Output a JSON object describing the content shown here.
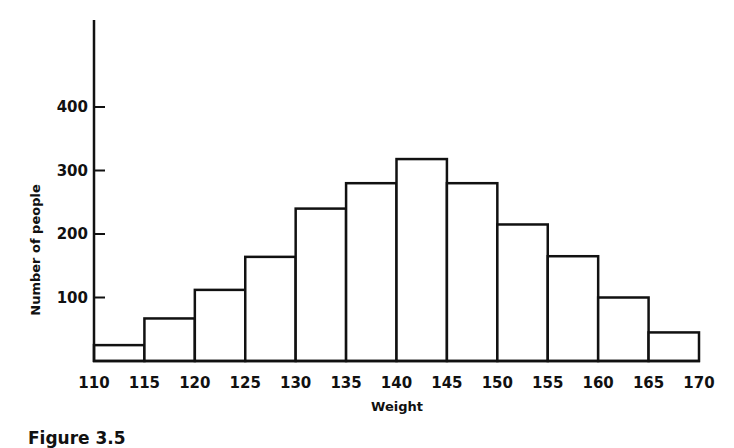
{
  "chart_data": {
    "type": "bar",
    "subtype": "histogram",
    "title": "",
    "xlabel": "Weight",
    "ylabel": "Number of people",
    "bin_edges": [
      110,
      115,
      120,
      125,
      130,
      135,
      140,
      145,
      150,
      155,
      160,
      165,
      170
    ],
    "categories": [
      "110-115",
      "115-120",
      "120-125",
      "125-130",
      "130-135",
      "135-140",
      "140-145",
      "145-150",
      "150-155",
      "155-160",
      "160-165",
      "165-170"
    ],
    "values": [
      25,
      67,
      112,
      164,
      240,
      280,
      318,
      280,
      215,
      165,
      100,
      45
    ],
    "x_ticks": [
      "110",
      "115",
      "120",
      "125",
      "130",
      "135",
      "140",
      "145",
      "150",
      "155",
      "160",
      "165",
      "170"
    ],
    "y_ticks": [
      "100",
      "200",
      "300",
      "400"
    ],
    "ylim": [
      0,
      530
    ],
    "xlim": [
      110,
      170
    ],
    "grid": false,
    "legend": null,
    "bar_fill": "#ffffff",
    "bar_edge": "#111111"
  },
  "caption": "Figure 3.5"
}
